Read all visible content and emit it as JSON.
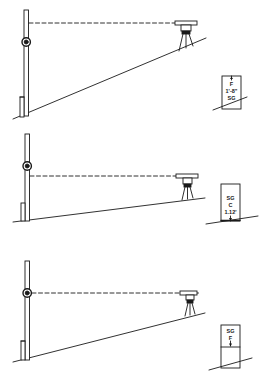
{
  "figure": {
    "stroke_color": "#1a1a1a",
    "background": "#ffffff",
    "panels": [
      {
        "id": "panel-1",
        "stake_labels": [
          "F",
          "1'-8\"",
          "SG"
        ],
        "stake_arrow": "up",
        "ground": "steep slope"
      },
      {
        "id": "panel-2",
        "stake_labels": [
          "SG",
          "C",
          "1.12'"
        ],
        "stake_arrow": "down",
        "ground": "gentle slope"
      },
      {
        "id": "panel-3",
        "stake_labels": [
          "SG",
          "F"
        ],
        "stake_arrow": "down",
        "ground": "moderate slope"
      }
    ]
  }
}
